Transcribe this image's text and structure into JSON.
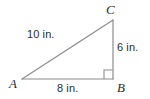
{
  "figure": {
    "type": "right-triangle-diagram",
    "background_color": "#ffffff",
    "stroke_color": "#8c8c8c",
    "text_color": "#2b2b2b"
  },
  "vertices": {
    "A": {
      "label": "A",
      "x": 22,
      "y": 79
    },
    "B": {
      "label": "B",
      "x": 113,
      "y": 79
    },
    "C": {
      "label": "C",
      "x": 113,
      "y": 20
    }
  },
  "sides": {
    "hypotenuse": {
      "label": "10 in.",
      "value": 10,
      "unit": "in.",
      "from": "A",
      "to": "C"
    },
    "vertical": {
      "label": "6 in.",
      "value": 6,
      "unit": "in.",
      "from": "C",
      "to": "B"
    },
    "base": {
      "label": "8 in.",
      "value": 8,
      "unit": "in.",
      "from": "A",
      "to": "B"
    }
  },
  "markers": {
    "right_angle": {
      "at": "B",
      "name": "right-angle-square"
    }
  },
  "chart_data": {
    "type": "diagram",
    "title": "",
    "shape": "right triangle",
    "categories": [
      "10 in.",
      "6 in.",
      "8 in."
    ],
    "values": [
      10,
      6,
      8
    ],
    "labels": [
      "A",
      "B",
      "C"
    ],
    "annotations": [
      "right angle at B"
    ]
  }
}
